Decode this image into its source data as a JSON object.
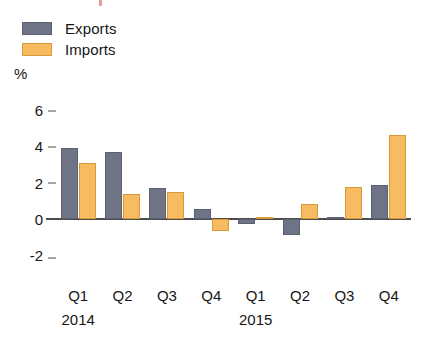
{
  "legend": {
    "items": [
      {
        "label": "Exports",
        "color": "#6e7486",
        "name": "exports"
      },
      {
        "label": "Imports",
        "color": "#f7bc62",
        "name": "imports"
      }
    ]
  },
  "axis": {
    "unit": "%",
    "yticks": [
      "6",
      "4",
      "2",
      "0",
      "-2"
    ]
  },
  "xaxis": {
    "quarters": [
      "Q1",
      "Q2",
      "Q3",
      "Q4",
      "Q1",
      "Q2",
      "Q3",
      "Q4"
    ],
    "years": [
      "2014",
      "2015"
    ]
  },
  "chart_data": {
    "type": "bar",
    "title": "",
    "xlabel": "",
    "ylabel": "%",
    "categories": [
      "Q1 2014",
      "Q2 2014",
      "Q3 2014",
      "Q4 2014",
      "Q1 2015",
      "Q2 2015",
      "Q3 2015",
      "Q4 2015"
    ],
    "series": [
      {
        "name": "Exports",
        "color": "#6e7486",
        "values": [
          3.9,
          3.7,
          1.7,
          0.55,
          -0.3,
          -0.9,
          0.1,
          1.85
        ]
      },
      {
        "name": "Imports",
        "color": "#f7bc62",
        "values": [
          3.1,
          1.35,
          1.5,
          -0.7,
          0.1,
          0.8,
          1.75,
          4.6
        ]
      }
    ],
    "ylim": [
      -2,
      6
    ],
    "ytick_values": [
      6,
      4,
      2,
      0,
      -2
    ],
    "grid": false,
    "legend_position": "top-left"
  }
}
